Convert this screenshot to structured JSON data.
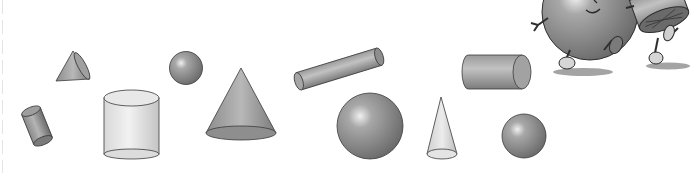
{
  "illustration": {
    "description": "Assorted 3D geometric solids with two cartoon characters (a sphere and a cylinder) walking",
    "colors": {
      "background": "#ffffff",
      "solid_dark": "#7a7a7a",
      "solid_mid": "#a8a8a8",
      "solid_light": "#e6e6e6",
      "outline": "#3a3a3a"
    },
    "shapes": [
      {
        "type": "cylinder",
        "label": "small tilted cylinder"
      },
      {
        "type": "cone",
        "label": "small cone lying on side"
      },
      {
        "type": "cylinder",
        "label": "large upright light cylinder"
      },
      {
        "type": "sphere",
        "label": "small sphere"
      },
      {
        "type": "cone",
        "label": "large upright cone"
      },
      {
        "type": "cylinder",
        "label": "long tilted cylinder"
      },
      {
        "type": "sphere",
        "label": "large sphere"
      },
      {
        "type": "cone",
        "label": "tall narrow light cone"
      },
      {
        "type": "cylinder",
        "label": "horizontal cylinder"
      },
      {
        "type": "sphere",
        "label": "medium sphere"
      }
    ],
    "characters": [
      {
        "type": "sphere-character",
        "label": "walking sphere cartoon"
      },
      {
        "type": "cylinder-character",
        "label": "walking cylinder cartoon"
      }
    ]
  }
}
